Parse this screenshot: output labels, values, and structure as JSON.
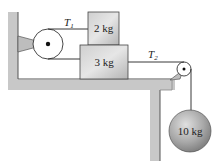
{
  "diagram": {
    "title": "",
    "blocks": [
      {
        "id": "block-top",
        "label": "2 kg"
      },
      {
        "id": "block-bottom",
        "label": "3 kg"
      }
    ],
    "hanging_mass": {
      "label": "10 kg"
    },
    "tensions": [
      {
        "symbol": "T",
        "subscript": "1"
      },
      {
        "symbol": "T",
        "subscript": "2"
      }
    ],
    "colors": {
      "structure": "#c8c8c8",
      "block": "#bcbcbc",
      "sphere": "#9a9a9a",
      "line": "#222222"
    }
  }
}
